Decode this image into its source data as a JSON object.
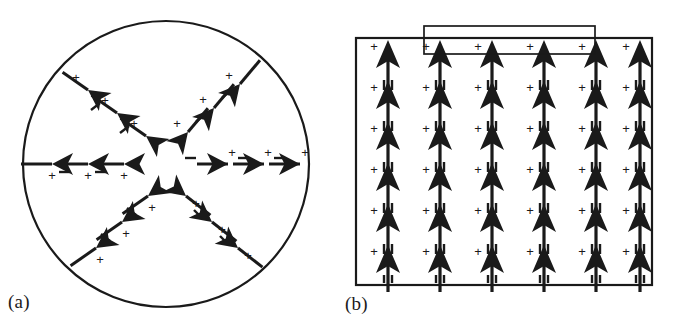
{
  "figure": {
    "background_color": "#ffffff",
    "ink_color": "#1a1a1a",
    "arrow_fill": "#1a1a1a",
    "width": 679,
    "height": 329
  },
  "panels": [
    {
      "id": "a",
      "label": "(a)",
      "shape": "circle",
      "description": "Circular disk with radial (hedgehog) polarization arms pointing outward from the center",
      "geometry": {
        "cx": 166,
        "cy": 164,
        "r": 143,
        "stroke_width": 2.2
      },
      "arm_count": 6,
      "dipoles_per_arm": 3,
      "charge_symbols": {
        "positive": "+",
        "negative": "−"
      },
      "arms": [
        {
          "name": "arm-west",
          "angle_deg": 180,
          "direction": "outward-left"
        },
        {
          "name": "arm-east",
          "angle_deg": 0,
          "direction": "outward-right"
        },
        {
          "name": "arm-northwest",
          "angle_deg": 140,
          "direction": "outward-up-left"
        },
        {
          "name": "arm-northeast",
          "angle_deg": 48,
          "direction": "outward-up-right"
        },
        {
          "name": "arm-southwest",
          "angle_deg": 218,
          "direction": "outward-down-left"
        },
        {
          "name": "arm-southeast",
          "angle_deg": 310,
          "direction": "outward-down-right"
        }
      ]
    },
    {
      "id": "b",
      "label": "(b)",
      "shape": "rectangle",
      "description": "Rectangular film with uniform upward polarization columns and a top electrode bar",
      "geometry": {
        "x": 16,
        "y": 38,
        "w": 296,
        "h": 247,
        "stroke_width": 2.2
      },
      "electrode": {
        "name": "top-electrode",
        "geometry": {
          "x": 84,
          "y": 26,
          "w": 171,
          "h": 28
        },
        "stroke_width": 1.7
      },
      "columns": 6,
      "rows": 6,
      "charge_symbols": {
        "positive": "+",
        "negative": "−"
      },
      "column_x": [
        48,
        100,
        152,
        204,
        256,
        300
      ],
      "row_y": [
        57,
        98,
        139,
        180,
        221,
        262
      ]
    }
  ]
}
